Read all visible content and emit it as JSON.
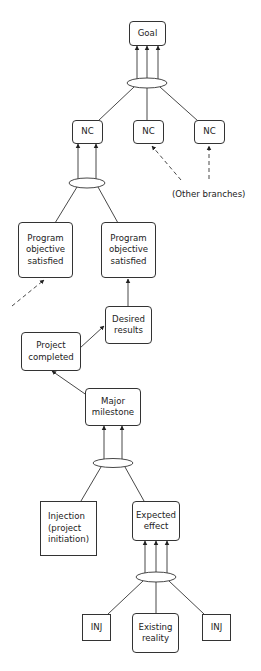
{
  "diagram": {
    "type": "logic tree (prerequisite / sufficiency diagram)",
    "colors": {
      "line": "#333333",
      "box_fill": "#ffffff",
      "text": "#222222"
    },
    "nodes": {
      "goal": {
        "label": "Goal",
        "shape": "rounded"
      },
      "nc1": {
        "label": "NC",
        "shape": "rounded"
      },
      "nc2": {
        "label": "NC",
        "shape": "rounded"
      },
      "nc3": {
        "label": "NC",
        "shape": "rounded"
      },
      "program_left": {
        "label": "Program\nobjective\nsatisfied",
        "shape": "rounded"
      },
      "program_right": {
        "label": "Program\nobjective\nsatisfied",
        "shape": "rounded"
      },
      "desired_results": {
        "label": "Desired\nresults",
        "shape": "rounded"
      },
      "project_completed": {
        "label": "Project\ncompleted",
        "shape": "rounded"
      },
      "major_milestone": {
        "label": "Major\nmilestone",
        "shape": "rounded"
      },
      "injection": {
        "label": "Injection\n(project\ninitiation)",
        "shape": "square"
      },
      "expected_effect": {
        "label": "Expected\neffect",
        "shape": "rounded"
      },
      "inj_left": {
        "label": "INJ",
        "shape": "square"
      },
      "existing_reality": {
        "label": "Existing\nreality",
        "shape": "rounded"
      },
      "inj_right": {
        "label": "INJ",
        "shape": "square"
      }
    },
    "annotations": {
      "other_branches": "(Other branches)"
    },
    "edges": [
      {
        "from": [
          "nc1",
          "nc2",
          "nc3"
        ],
        "to": "goal",
        "type": "and-junction",
        "arrows": 3
      },
      {
        "from": [
          "program_left",
          "program_right"
        ],
        "to": "nc1",
        "type": "and-junction",
        "arrows": 2
      },
      {
        "from": "other_branches",
        "to": "nc2",
        "style": "dashed"
      },
      {
        "from": "other_branches",
        "to": "nc3",
        "style": "dashed"
      },
      {
        "from": "offscreen",
        "to": "program_left",
        "style": "dashed"
      },
      {
        "from": "desired_results",
        "to": "program_right"
      },
      {
        "from": "project_completed",
        "to": "desired_results"
      },
      {
        "from": "major_milestone",
        "to": "project_completed"
      },
      {
        "from": [
          "injection",
          "expected_effect"
        ],
        "to": "major_milestone",
        "type": "and-junction",
        "arrows": 2
      },
      {
        "from": [
          "inj_left",
          "existing_reality",
          "inj_right"
        ],
        "to": "expected_effect",
        "type": "and-junction",
        "arrows": 3
      }
    ]
  }
}
